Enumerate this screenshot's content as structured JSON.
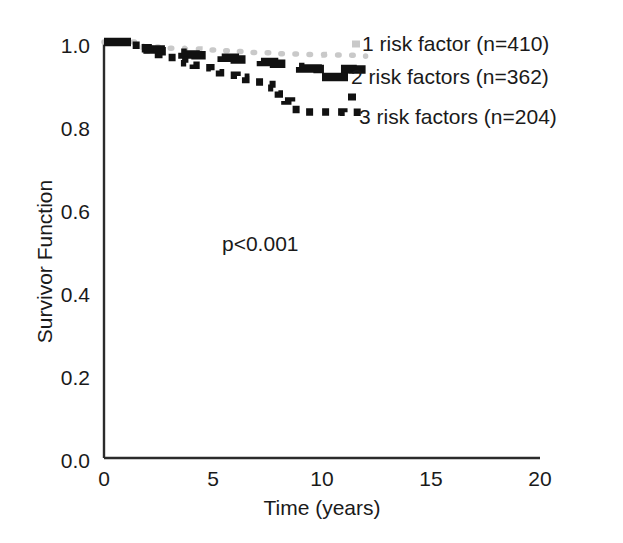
{
  "chart_data": {
    "type": "line",
    "title": "",
    "xlabel": "Time (years)",
    "ylabel": "Survivor Function",
    "xlim": [
      0,
      20
    ],
    "ylim": [
      0.0,
      1.0
    ],
    "xticks": [
      "0",
      "5",
      "10",
      "15",
      "20"
    ],
    "xtick_values": [
      0,
      5,
      10,
      15,
      20
    ],
    "yticks": [
      "0.0",
      "0.2",
      "0.4",
      "0.6",
      "0.8",
      "1.0"
    ],
    "ytick_values": [
      0.0,
      0.2,
      0.4,
      0.6,
      0.8,
      1.0
    ],
    "grid": false,
    "legend_position": "inside-right",
    "annotations": [
      {
        "text": "p<0.001",
        "x": 5.4,
        "y": 0.545
      }
    ],
    "series": [
      {
        "name": "1 risk factor (n=410)",
        "label": "1 risk factor (n=410)",
        "n": 410,
        "color": "#c9c9c9",
        "style": "dotted",
        "x": [
          0.0,
          0.6,
          1.2,
          1.8,
          2.4,
          3.0,
          3.7,
          4.4,
          5.1,
          5.8,
          6.6,
          7.3,
          8.0,
          8.7,
          9.4,
          10.1,
          10.8,
          11.5,
          12.0
        ],
        "y": [
          1.0,
          1.0,
          1.0,
          0.988,
          0.988,
          0.985,
          0.983,
          0.981,
          0.979,
          0.977,
          0.975,
          0.974,
          0.972,
          0.971,
          0.97,
          0.969,
          0.968,
          0.967,
          0.966
        ]
      },
      {
        "name": "2 risk factors (n=362)",
        "label": "2 risk factors (n=362)",
        "n": 362,
        "color": "#111111",
        "style": "dashed",
        "x": [
          0.0,
          0.8,
          1.3,
          1.5,
          2.0,
          2.6,
          3.2,
          3.6,
          4.2,
          4.8,
          5.4,
          6.0,
          6.6,
          7.2,
          7.8,
          8.4,
          9.0,
          9.8,
          10.6,
          11.4,
          12.0
        ],
        "y": [
          1.0,
          1.0,
          0.998,
          0.985,
          0.982,
          0.978,
          0.974,
          0.97,
          0.968,
          0.966,
          0.962,
          0.958,
          0.955,
          0.952,
          0.948,
          0.94,
          0.936,
          0.935,
          0.935,
          0.934,
          0.934
        ]
      },
      {
        "name": "3 risk factors (n=204)",
        "label": "3 risk factors (n=204)",
        "n": 204,
        "color": "#111111",
        "style": "square-dotted",
        "x": [
          0.0,
          0.8,
          1.3,
          1.7,
          2.1,
          2.5,
          2.9,
          3.3,
          3.7,
          4.1,
          4.5,
          4.9,
          5.3,
          5.7,
          6.1,
          6.5,
          6.9,
          7.3,
          7.7,
          8.0,
          8.3,
          8.6,
          9.2,
          9.8,
          10.4,
          11.0,
          11.6,
          12.0
        ],
        "y": [
          1.0,
          1.0,
          0.992,
          0.982,
          0.976,
          0.97,
          0.963,
          0.957,
          0.95,
          0.944,
          0.938,
          0.932,
          0.926,
          0.92,
          0.915,
          0.91,
          0.904,
          0.898,
          0.89,
          0.875,
          0.858,
          0.838,
          0.832,
          0.832,
          0.832,
          0.831,
          0.831,
          0.831
        ]
      }
    ]
  },
  "axes": {
    "y_title": "Survivor Function",
    "x_title": "Time (years)",
    "y_tick_labels": [
      "1.0",
      "0.8",
      "0.6",
      "0.4",
      "0.2",
      "0.0"
    ],
    "x_tick_labels": [
      "0",
      "5",
      "10",
      "15",
      "20"
    ]
  },
  "annotation": {
    "pvalue": "p<0.001"
  },
  "legend": {
    "items": [
      {
        "label": "1 risk factor (n=410)"
      },
      {
        "label": "2 risk factors (n=362)"
      },
      {
        "label": "3 risk factors (n=204)"
      }
    ]
  }
}
